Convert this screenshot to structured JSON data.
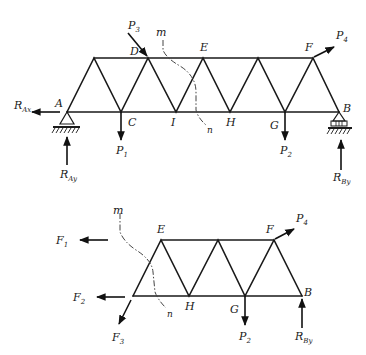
{
  "diagram": {
    "type": "truss-method-of-sections",
    "upper_figure": {
      "title": "Full truss with supports and loads",
      "nodes": {
        "A": {
          "label": "A"
        },
        "C": {
          "label": "C"
        },
        "I": {
          "label": "I"
        },
        "H": {
          "label": "H"
        },
        "G": {
          "label": "G"
        },
        "B": {
          "label": "B"
        },
        "D": {
          "label": "D"
        },
        "E": {
          "label": "E"
        },
        "F": {
          "label": "F"
        }
      },
      "loads": {
        "P1": {
          "main": "P",
          "sub": "1"
        },
        "P2": {
          "main": "P",
          "sub": "2"
        },
        "P3": {
          "main": "P",
          "sub": "3"
        },
        "P4": {
          "main": "P",
          "sub": "4"
        }
      },
      "reactions": {
        "RAx": {
          "main": "R",
          "sub": "Ax"
        },
        "RAy": {
          "main": "R",
          "sub": "Ay"
        },
        "RBy": {
          "main": "R",
          "sub": "By"
        }
      },
      "section_cut": {
        "start": "m",
        "end": "n"
      },
      "supports": {
        "A": "pinned",
        "B": "roller"
      }
    },
    "lower_figure": {
      "title": "Free body of right portion after section m-n",
      "nodes": {
        "E": {
          "label": "E"
        },
        "F": {
          "label": "F"
        },
        "H": {
          "label": "H"
        },
        "G": {
          "label": "G"
        },
        "B": {
          "label": "B"
        }
      },
      "member_forces": {
        "F1": {
          "main": "F",
          "sub": "1"
        },
        "F2": {
          "main": "F",
          "sub": "2"
        },
        "F3": {
          "main": "F",
          "sub": "3"
        }
      },
      "loads": {
        "P2": {
          "main": "P",
          "sub": "2"
        },
        "P4": {
          "main": "P",
          "sub": "4"
        }
      },
      "reactions": {
        "RBy": {
          "main": "R",
          "sub": "By"
        }
      },
      "section_cut": {
        "start": "m",
        "end": "n"
      }
    }
  }
}
